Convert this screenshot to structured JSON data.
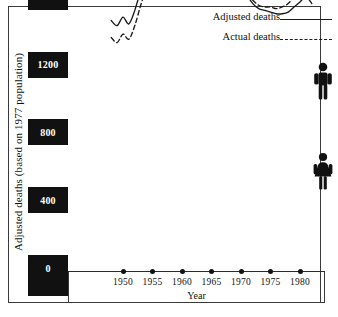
{
  "chart_data": {
    "type": "line",
    "title": "",
    "xlabel": "Year",
    "ylabel": "Adjusted deaths (based on 1977 population)",
    "xlim": [
      1947,
      1983
    ],
    "ylim": [
      0,
      3700
    ],
    "grid": false,
    "legend_position": "top-right",
    "ytick_labels": [
      "3600",
      "3200",
      "2800",
      "2400",
      "2000",
      "1600",
      "1200",
      "800",
      "400",
      "0"
    ],
    "ytick_values": [
      3600,
      3200,
      2800,
      2400,
      2000,
      1600,
      1200,
      800,
      400,
      0
    ],
    "xtick_labels": [
      "1950",
      "1955",
      "1960",
      "1965",
      "1970",
      "1975",
      "1980"
    ],
    "xtick_values": [
      1950,
      1955,
      1960,
      1965,
      1970,
      1975,
      1980
    ],
    "group_labels": [
      "Males",
      "Females"
    ],
    "series": [
      {
        "name": "Adjusted deaths",
        "group": "Males",
        "style": "solid",
        "x": [
          1948,
          1949,
          1950,
          1951,
          1952,
          1953,
          1954,
          1955,
          1956,
          1957,
          1958,
          1959,
          1960,
          1961,
          1962,
          1963,
          1964,
          1965,
          1966,
          1967,
          1968,
          1969,
          1970,
          1971,
          1972,
          1973,
          1974,
          1975,
          1976,
          1977,
          1978,
          1979,
          1980,
          1981,
          1982
        ],
        "y": [
          3125,
          3130,
          3120,
          3150,
          3230,
          3330,
          3420,
          3480,
          3430,
          3500,
          3400,
          3460,
          3490,
          3460,
          3420,
          3380,
          3340,
          3270,
          3170,
          3060,
          2960,
          2850,
          2720,
          2620,
          2540,
          2470,
          2420,
          2400,
          2380,
          2410,
          2470,
          2560,
          2660,
          2760,
          2830
        ]
      },
      {
        "name": "Actual deaths",
        "group": "Males",
        "style": "dashed",
        "x": [
          1948,
          1949,
          1950,
          1951,
          1952,
          1953,
          1954,
          1955,
          1956,
          1957,
          1958,
          1959,
          1960,
          1961,
          1962,
          1963,
          1964,
          1965,
          1966,
          1967,
          1968,
          1969,
          1970,
          1971,
          1972,
          1973,
          1974,
          1975,
          1976,
          1977,
          1978,
          1979,
          1980,
          1981,
          1982
        ],
        "y": [
          2700,
          2680,
          2690,
          2720,
          2810,
          2900,
          2980,
          3060,
          3010,
          3090,
          3060,
          3120,
          3170,
          3180,
          3170,
          3160,
          3130,
          3080,
          3000,
          2900,
          2810,
          2710,
          2610,
          2530,
          2470,
          2420,
          2390,
          2390,
          2390,
          2440,
          2520,
          2620,
          2740,
          2850,
          2910
        ]
      },
      {
        "name": "Adjusted deaths",
        "group": "Females",
        "style": "solid",
        "x": [
          1948,
          1949,
          1950,
          1951,
          1952,
          1953,
          1954,
          1955,
          1956,
          1957,
          1958,
          1959,
          1960,
          1961,
          1962,
          1963,
          1964,
          1965,
          1966,
          1967,
          1968,
          1969,
          1970,
          1971,
          1972,
          1973,
          1974,
          1975,
          1976,
          1977,
          1978,
          1979,
          1980,
          1981,
          1982
        ],
        "y": [
          1460,
          1430,
          1480,
          1440,
          1520,
          1640,
          1740,
          1800,
          1790,
          1830,
          1810,
          1870,
          1930,
          2000,
          2070,
          2110,
          2080,
          2020,
          1950,
          1880,
          1810,
          1740,
          1670,
          1610,
          1560,
          1530,
          1520,
          1510,
          1500,
          1500,
          1510,
          1540,
          1570,
          1600,
          1560
        ]
      },
      {
        "name": "Actual deaths",
        "group": "Females",
        "style": "dashed",
        "x": [
          1948,
          1949,
          1950,
          1951,
          1952,
          1953,
          1954,
          1955,
          1956,
          1957,
          1958,
          1959,
          1960,
          1961,
          1962,
          1963,
          1964,
          1965,
          1966,
          1967,
          1968,
          1969,
          1970,
          1971,
          1972,
          1973,
          1974,
          1975,
          1976,
          1977,
          1978,
          1979,
          1980,
          1981,
          1982
        ],
        "y": [
          1360,
          1330,
          1380,
          1350,
          1430,
          1550,
          1650,
          1720,
          1710,
          1760,
          1750,
          1820,
          1890,
          1960,
          2040,
          2090,
          2070,
          2010,
          1940,
          1870,
          1810,
          1740,
          1680,
          1620,
          1580,
          1550,
          1540,
          1540,
          1530,
          1540,
          1560,
          1600,
          1640,
          1670,
          1620
        ]
      }
    ]
  },
  "axes": {
    "y_title": "Adjusted deaths (based on 1977 population)",
    "x_title": "Year"
  },
  "legend": {
    "items": [
      {
        "label": "Adjusted deaths",
        "style": "solid"
      },
      {
        "label": "Actual deaths",
        "style": "dashed"
      }
    ]
  },
  "icons": {
    "male": "male-figure-icon",
    "female": "female-figure-icon"
  },
  "colors": {
    "ink": "#1a1a1a",
    "label_block_bg": "#111111",
    "label_block_text": "#ffffff",
    "frame": "#3a3a3a",
    "page_bg": "#ffffff"
  }
}
